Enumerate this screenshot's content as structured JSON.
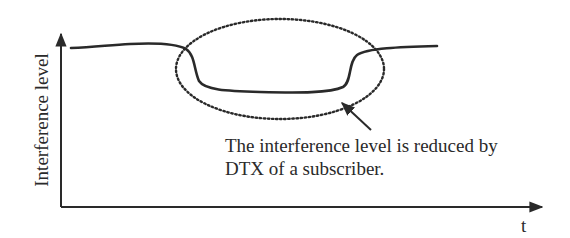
{
  "diagram": {
    "y_axis_label": "Interference level",
    "x_axis_label": "t",
    "annotation": {
      "line1": "The interference level is reduced by",
      "line2": "DTX of a subscriber."
    },
    "colors": {
      "ink": "#2a2a2a",
      "background": "#ffffff"
    }
  }
}
